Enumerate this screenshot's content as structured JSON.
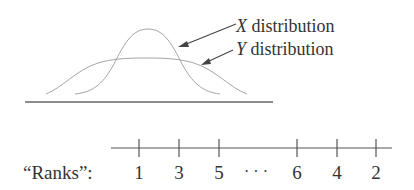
{
  "figure": {
    "distributions": {
      "x_label_var": "X",
      "y_label_var": "Y",
      "label_suffix": " distribution",
      "curve_color": "#9a9a9a",
      "axis_color": "#555555"
    },
    "ranks": {
      "label": "“Ranks”:",
      "values": [
        "1",
        "3",
        "5",
        "6",
        "4",
        "2"
      ],
      "ellipsis": "· · ·"
    }
  }
}
